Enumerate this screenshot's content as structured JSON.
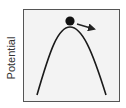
{
  "diagram": {
    "type": "potential-energy-diagram",
    "y_axis_label": "Potential",
    "curve": "inverted-parabola (unstable equilibrium)",
    "ball": {
      "position": "at peak",
      "description": "ball resting on top of potential hill"
    },
    "arrow": {
      "direction": "down-right",
      "meaning": "ball tends to roll off the hill"
    },
    "colors": {
      "frame_border": "#555555",
      "frame_fill": "#f3f3f3",
      "curve": "#1a1a1a",
      "ball": "#111111",
      "arrow": "#222222",
      "label": "#333333"
    }
  }
}
